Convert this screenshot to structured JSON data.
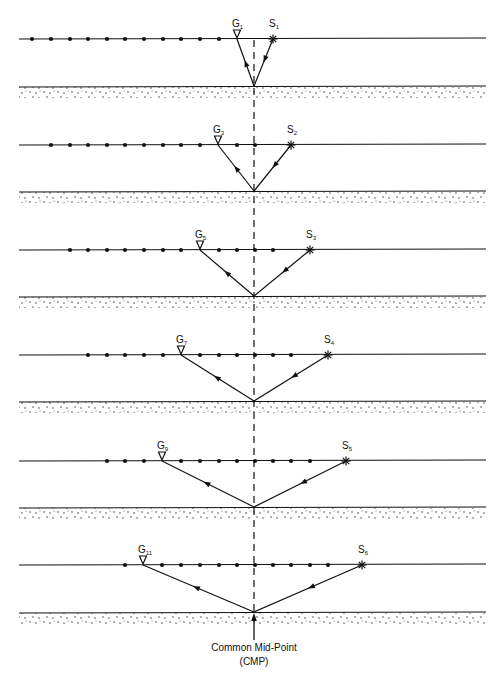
{
  "diagram": {
    "cmp_label_line1": "Common Mid-Point",
    "cmp_label_line2": "(CMP)",
    "colors": {
      "ink": "#111111",
      "background": "#ffffff"
    },
    "geometry": {
      "line_x_start": 19,
      "line_x_end": 486,
      "cmp_x": 254,
      "geophone_spacing": 18.6
    },
    "panels": [
      {
        "surface_y": 39,
        "reflector_y": 86,
        "geophone": "G",
        "geophone_sub": "1",
        "geophone_x": 237,
        "source": "S",
        "source_sub": "1",
        "source_x": 273,
        "dots_x": [
          32,
          51,
          70,
          88,
          107,
          125,
          144,
          163,
          181,
          200,
          219
        ]
      },
      {
        "surface_y": 145,
        "reflector_y": 191,
        "geophone": "G",
        "geophone_sub": "3",
        "geophone_x": 218,
        "source": "S",
        "source_sub": "2",
        "source_x": 291,
        "dots_x": [
          51,
          70,
          88,
          107,
          125,
          144,
          163,
          181,
          200,
          237,
          255
        ]
      },
      {
        "surface_y": 250,
        "reflector_y": 296,
        "geophone": "G",
        "geophone_sub": "5",
        "geophone_x": 200,
        "source": "S",
        "source_sub": "3",
        "source_x": 310,
        "dots_x": [
          70,
          88,
          107,
          125,
          144,
          163,
          181,
          219,
          237,
          255,
          273
        ]
      },
      {
        "surface_y": 355,
        "reflector_y": 401,
        "geophone": "G",
        "geophone_sub": "7",
        "geophone_x": 181,
        "source": "S",
        "source_sub": "4",
        "source_x": 328,
        "dots_x": [
          88,
          107,
          125,
          144,
          163,
          200,
          219,
          237,
          255,
          273,
          291
        ]
      },
      {
        "surface_y": 461,
        "reflector_y": 507,
        "geophone": "G",
        "geophone_sub": "9",
        "geophone_x": 162,
        "source": "S",
        "source_sub": "5",
        "source_x": 346,
        "dots_x": [
          107,
          125,
          144,
          181,
          200,
          219,
          237,
          255,
          273,
          291,
          310
        ]
      },
      {
        "surface_y": 565,
        "reflector_y": 612,
        "geophone": "G",
        "geophone_sub": "11",
        "geophone_x": 143,
        "source": "S",
        "source_sub": "6",
        "source_x": 362,
        "dots_x": [
          125,
          162,
          181,
          200,
          219,
          237,
          255,
          273,
          291,
          310,
          328
        ]
      }
    ]
  }
}
